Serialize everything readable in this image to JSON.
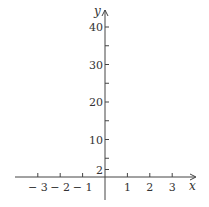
{
  "chart_data": {
    "type": "line",
    "title": "",
    "xlabel": "x",
    "ylabel": "y",
    "xlim": [
      -3.9,
      3.9
    ],
    "ylim": [
      -6,
      44
    ],
    "grid": false,
    "series": [],
    "x_ticks": [
      -3,
      -2,
      -1,
      1,
      2,
      3
    ],
    "x_tick_labels": [
      "− 3",
      "− 2",
      "− 1",
      "1",
      "2",
      "3"
    ],
    "y_ticks_labeled": [
      2,
      10,
      20,
      30,
      40
    ],
    "y_tick_labels": [
      "2",
      "10",
      "20",
      "30",
      "40"
    ],
    "y_ticks_minor": [
      5,
      15,
      25,
      35
    ]
  },
  "colors": {
    "axis": "#444444",
    "text": "#333333",
    "background": "#ffffff"
  }
}
